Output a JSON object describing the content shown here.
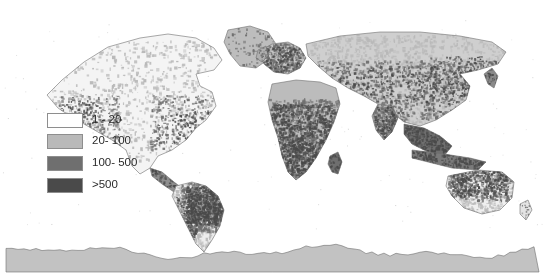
{
  "figure": {
    "type": "world-choropleth-map",
    "projection": "equirectangular",
    "background_color": "#ffffff",
    "ocean_color": "#ffffff",
    "border_color": "#6e6e6e",
    "width": 545,
    "height": 279
  },
  "legend": {
    "name": "density-class-legend",
    "position": {
      "x": 47,
      "y": 110
    },
    "row_height": 20,
    "swatch": {
      "width": 36,
      "height": 15,
      "border_color": "#8e8e8e"
    },
    "items": [
      {
        "label": "1 - 20",
        "color": "#ffffff",
        "min": 1,
        "max": 20
      },
      {
        "label": "20- 100",
        "color": "#b9b9b9",
        "min": 20,
        "max": 100
      },
      {
        "label": "100- 500",
        "color": "#6f6f6f",
        "min": 100,
        "max": 500
      },
      {
        "label": ">500",
        "color": "#4a4a4a",
        "min": 500,
        "max": null
      }
    ]
  },
  "chart_data": {
    "type": "heatmap",
    "title": "",
    "xlabel": "",
    "ylabel": "",
    "grid": false,
    "legend_position": "inset-left",
    "categories": [
      "1 - 20",
      "20- 100",
      "100- 500",
      ">500"
    ],
    "values": [
      4,
      3,
      2,
      1
    ],
    "class_colors": [
      "#ffffff",
      "#b9b9b9",
      "#6f6f6f",
      "#4a4a4a"
    ],
    "regions": [
      {
        "name": "Antarctica",
        "class": "20- 100",
        "fill": "#c2c2c2",
        "note": "uniform light gray band across bottom"
      },
      {
        "name": "Greenland",
        "class": "20- 100",
        "fill": "#bdbdbd"
      },
      {
        "name": "Northern Canada / Alaska",
        "class": "1 - 20",
        "fill": "#f2f2f2"
      },
      {
        "name": "Western North America coast",
        "class": "100- 500",
        "fill": "#6f6f6f"
      },
      {
        "name": "Eastern United States",
        "class": "20- 100",
        "fill": "#bcbcbc"
      },
      {
        "name": "Central America",
        "class": "100- 500",
        "fill": "#6b6b6b"
      },
      {
        "name": "Amazon / Brazil",
        "class": ">500",
        "fill": "#4a4a4a"
      },
      {
        "name": "Southern South America",
        "class": "1 - 20",
        "fill": "#ededed"
      },
      {
        "name": "Sahara / North Africa",
        "class": "20- 100",
        "fill": "#bcbcbc"
      },
      {
        "name": "Sub-Saharan Africa",
        "class": ">500",
        "fill": "#4a4a4a"
      },
      {
        "name": "Europe",
        "class": "100- 500",
        "fill": "#787878"
      },
      {
        "name": "Central Asia belt",
        "class": "100- 500",
        "fill": "#6c6c6c"
      },
      {
        "name": "Siberia",
        "class": "20- 100",
        "fill": "#c4c4c4"
      },
      {
        "name": "India",
        "class": "20- 100",
        "fill": "#b4b4b4"
      },
      {
        "name": "Southeast Asia",
        "class": ">500",
        "fill": "#4f4f4f"
      },
      {
        "name": "Eastern China",
        "class": "100- 500",
        "fill": "#6f6f6f"
      },
      {
        "name": "Northern and Eastern Australia",
        "class": "100- 500",
        "fill": "#666666"
      },
      {
        "name": "Central Australia",
        "class": "1 - 20",
        "fill": "#efefef"
      },
      {
        "name": "Madagascar",
        "class": "100- 500",
        "fill": "#6f6f6f"
      },
      {
        "name": "New Zealand",
        "class": "1 - 20",
        "fill": "#f0f0f0"
      }
    ]
  }
}
